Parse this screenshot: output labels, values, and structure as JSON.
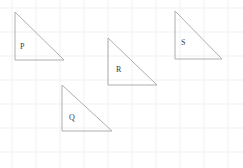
{
  "canvas": {
    "width": 243,
    "height": 168,
    "background_color": "#ffffff"
  },
  "grid": {
    "visible": true,
    "line_color": "#eef1f5",
    "spacing_x": 24,
    "spacing_y": 24,
    "offset_x": 12,
    "offset_y": 8,
    "stroke_width": 1
  },
  "style": {
    "shape_stroke_color": "#aeaeae",
    "shape_fill_color": "none",
    "shape_stroke_width": 1,
    "label_color": "#3b3b3b",
    "label_font_size": 8
  },
  "figures": [
    {
      "id": "triangle-p",
      "label": "P",
      "shape": "right-triangle",
      "points": "15,12 15,60 64,60",
      "vertices": [
        [
          15,
          12
        ],
        [
          15,
          60
        ],
        [
          64,
          60
        ]
      ],
      "leg_vertical": 48,
      "leg_horizontal": 49,
      "right_angle_at": [
        15,
        60
      ],
      "label_x": 20,
      "label_y": 43
    },
    {
      "id": "triangle-q",
      "label": "Q",
      "shape": "right-triangle",
      "points": "62,85 62,131 112,131",
      "vertices": [
        [
          62,
          85
        ],
        [
          62,
          131
        ],
        [
          112,
          131
        ]
      ],
      "leg_vertical": 46,
      "leg_horizontal": 50,
      "right_angle_at": [
        62,
        131
      ],
      "label_x": 69,
      "label_y": 114
    },
    {
      "id": "triangle-r",
      "label": "R",
      "shape": "right-triangle",
      "points": "108,38 108,85 157,85",
      "vertices": [
        [
          108,
          38
        ],
        [
          108,
          85
        ],
        [
          157,
          85
        ]
      ],
      "leg_vertical": 47,
      "leg_horizontal": 49,
      "right_angle_at": [
        108,
        85
      ],
      "label_x": 116,
      "label_y": 66
    },
    {
      "id": "triangle-s",
      "label": "S",
      "shape": "right-triangle",
      "points": "175,11 175,59 222,59",
      "vertices": [
        [
          175,
          11
        ],
        [
          175,
          59
        ],
        [
          222,
          59
        ]
      ],
      "leg_vertical": 48,
      "leg_horizontal": 47,
      "right_angle_at": [
        175,
        59
      ],
      "label_x": 181,
      "label_y": 39
    }
  ]
}
